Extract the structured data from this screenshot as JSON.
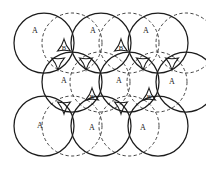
{
  "figure": {
    "canvas": {
      "width": 206,
      "height": 169
    },
    "colors": {
      "background": "#ffffff",
      "solid_stroke": "#1c1c1c",
      "dashed_stroke": "#3a3a3a",
      "label": "#1a1a1a"
    },
    "geometry": {
      "sphere_radius": 30,
      "dashed_radius": 30,
      "row_pitch": 57,
      "row_offset": 28.5
    }
  },
  "chart_data": {
    "type": "scatter",
    "xlabel": "",
    "ylabel": "",
    "xlim": [
      0,
      206
    ],
    "ylim": [
      0,
      169
    ],
    "grid": false,
    "legend": null,
    "series": [
      {
        "name": "A layer spheres (solid)",
        "marker": "circle-outline",
        "radius": 30,
        "points": [
          {
            "x": 44,
            "y": 43,
            "label": "A"
          },
          {
            "x": 101,
            "y": 43,
            "label": "A"
          },
          {
            "x": 158,
            "y": 43,
            "label": "A"
          },
          {
            "x": 72,
            "y": 82,
            "label": "A"
          },
          {
            "x": 129,
            "y": 82,
            "label": "A"
          },
          {
            "x": 186,
            "y": 82,
            "label": "A"
          },
          {
            "x": 44,
            "y": 126,
            "label": "A"
          },
          {
            "x": 101,
            "y": 126,
            "label": "A"
          },
          {
            "x": 158,
            "y": 126,
            "label": "A"
          }
        ]
      },
      {
        "name": "Second layer spheres (dashed)",
        "marker": "circle-dashed",
        "radius": 30,
        "points": [
          {
            "x": 72,
            "y": 43,
            "label": ""
          },
          {
            "x": 129,
            "y": 43,
            "label": ""
          },
          {
            "x": 186,
            "y": 43,
            "label": ""
          },
          {
            "x": 100,
            "y": 82,
            "label": ""
          },
          {
            "x": 157,
            "y": 82,
            "label": ""
          },
          {
            "x": 72,
            "y": 126,
            "label": ""
          },
          {
            "x": 129,
            "y": 126,
            "label": ""
          }
        ]
      }
    ],
    "annotations": [
      {
        "text": "A",
        "x": 35,
        "y": 31,
        "site": "a-site"
      },
      {
        "text": "A",
        "x": 93,
        "y": 31,
        "site": "a-site"
      },
      {
        "text": "A",
        "x": 146,
        "y": 31,
        "site": "a-site"
      },
      {
        "text": "A",
        "x": 64,
        "y": 81,
        "site": "a-site"
      },
      {
        "text": "A",
        "x": 119,
        "y": 81,
        "site": "a-site"
      },
      {
        "text": "A",
        "x": 172,
        "y": 82,
        "site": "a-site"
      },
      {
        "text": "A",
        "x": 40,
        "y": 126,
        "site": "a-site"
      },
      {
        "text": "A",
        "x": 92,
        "y": 128,
        "site": "a-site"
      },
      {
        "text": "A",
        "x": 143,
        "y": 128,
        "site": "a-site"
      },
      {
        "text": "B",
        "x": 64,
        "y": 49,
        "site": "b-void"
      },
      {
        "text": "B",
        "x": 121,
        "y": 49,
        "site": "b-void"
      },
      {
        "text": "B",
        "x": 92,
        "y": 98,
        "site": "b-void"
      },
      {
        "text": "B",
        "x": 149,
        "y": 98,
        "site": "b-void"
      }
    ],
    "void_sites": [
      {
        "x": 64,
        "y": 46,
        "orientation": "down",
        "label": "B"
      },
      {
        "x": 121,
        "y": 46,
        "orientation": "down",
        "label": "B"
      },
      {
        "x": 92,
        "y": 95,
        "orientation": "down",
        "label": "B"
      },
      {
        "x": 149,
        "y": 95,
        "orientation": "down",
        "label": "B"
      },
      {
        "x": 86,
        "y": 63,
        "orientation": "up",
        "label": ""
      },
      {
        "x": 143,
        "y": 63,
        "orientation": "up",
        "label": ""
      },
      {
        "x": 58,
        "y": 63,
        "orientation": "up",
        "label": ""
      },
      {
        "x": 172,
        "y": 63,
        "orientation": "up",
        "label": ""
      },
      {
        "x": 64,
        "y": 107,
        "orientation": "up",
        "label": ""
      },
      {
        "x": 121,
        "y": 107,
        "orientation": "up",
        "label": ""
      }
    ]
  },
  "labels": {
    "a_site": "A",
    "b_site": "B"
  }
}
